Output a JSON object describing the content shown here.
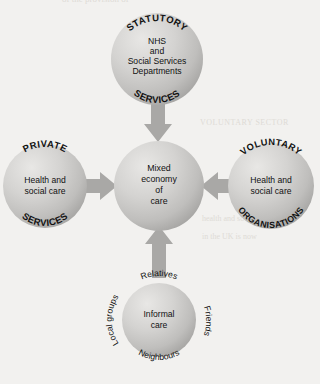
{
  "diagram": {
    "title": "Mixed economy of care",
    "background_color": "#f2f1ef",
    "sphere_fill_light": "#e3e2e0",
    "sphere_fill_mid": "#c9c8c6",
    "sphere_fill_dark": "#a9a8a6",
    "arrow_color": "#a9a8a6",
    "text_color": "#111111",
    "center": {
      "name": "mixed-economy-of-care",
      "lines": [
        "Mixed",
        "economy",
        "of",
        "care"
      ]
    },
    "nodes": [
      {
        "id": "statutory",
        "position": "top",
        "top_arc_label": "STATUTORY",
        "bottom_arc_label": "SERVICES",
        "lines": [
          "NHS",
          "and",
          "Social Services",
          "Departments"
        ]
      },
      {
        "id": "private",
        "position": "left",
        "top_arc_label": "PRIVATE",
        "bottom_arc_label": "SERVICES",
        "lines": [
          "Health and",
          "social care"
        ]
      },
      {
        "id": "voluntary",
        "position": "right",
        "top_arc_label": "VOLUNTARY",
        "bottom_arc_label": "ORGANISATIONS",
        "lines": [
          "Health and",
          "social care"
        ]
      },
      {
        "id": "informal",
        "position": "bottom",
        "top_arc_label": "",
        "bottom_arc_label": "",
        "lines": [
          "Informal",
          "care"
        ],
        "outside_labels": {
          "top": "Relatives",
          "right": "Friends",
          "bottom": "Neighbours",
          "left": "Local groups"
        }
      }
    ],
    "arrows": [
      {
        "id": "arrow-statutory-to-centre",
        "direction": "down"
      },
      {
        "id": "arrow-private-to-centre",
        "direction": "right"
      },
      {
        "id": "arrow-voluntary-to-centre",
        "direction": "left"
      },
      {
        "id": "arrow-informal-to-centre",
        "direction": "up"
      }
    ],
    "bleed_through": [
      {
        "text": "of the provision of",
        "x": 62,
        "y": -4
      },
      {
        "text": "VOLUNTARY SECTOR",
        "x": 196,
        "y": 122
      },
      {
        "text": "health and social",
        "x": 198,
        "y": 218
      },
      {
        "text": "in the UK is now",
        "x": 198,
        "y": 236
      }
    ]
  }
}
